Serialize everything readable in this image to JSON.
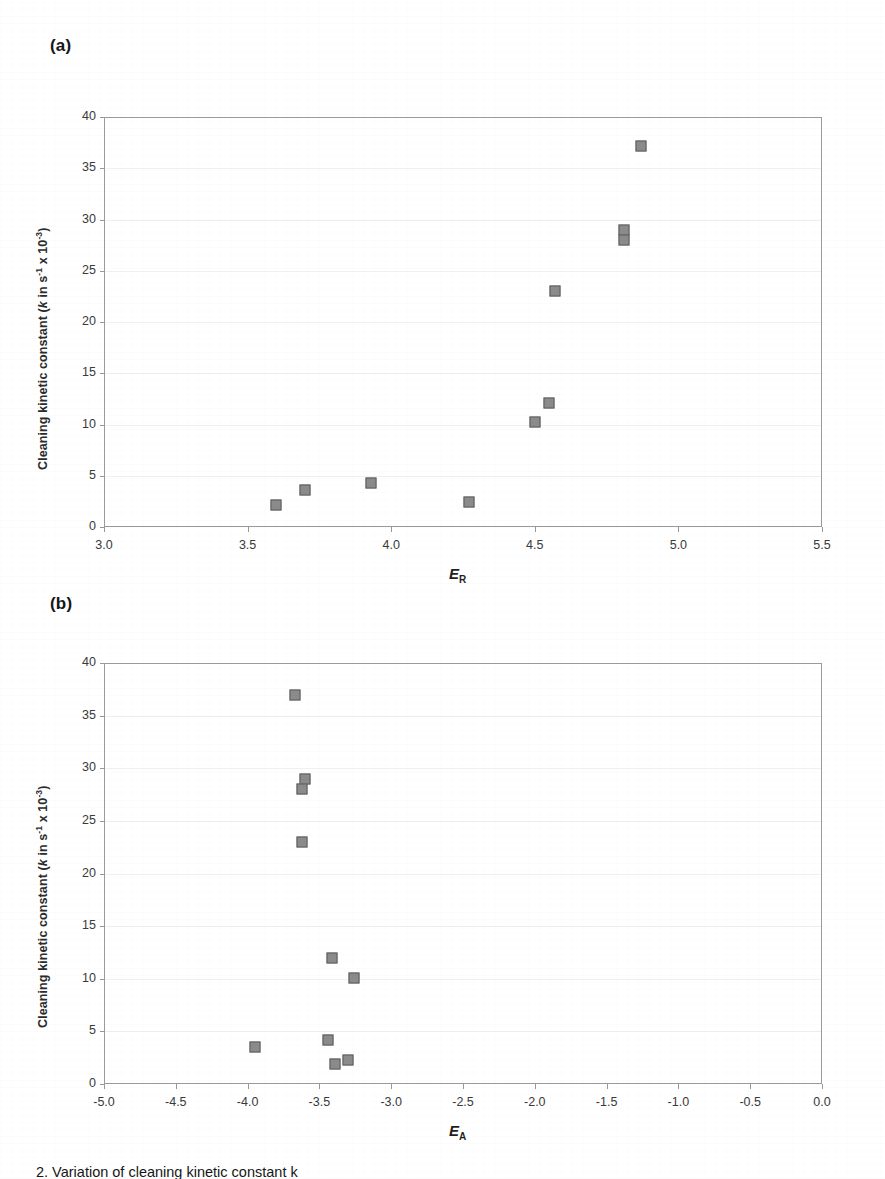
{
  "figure": {
    "panels": [
      {
        "letter": "(a)",
        "ylabel_text": "Cleaning kinetic constant (k in s-1 x 10-3)",
        "xlabel_text": "E",
        "xlabel_sub": "R"
      },
      {
        "letter": "(b)",
        "ylabel_text": "Cleaning kinetic constant (k in s-1 x 10-3)",
        "xlabel_text": "E",
        "xlabel_sub": "A"
      }
    ],
    "caption": "2. Variation of cleaning kinetic constant k"
  },
  "chart_data": [
    {
      "type": "scatter",
      "title": "(a)",
      "xlabel": "E_R",
      "ylabel": "Cleaning kinetic constant (k in s^-1 x 10^-3)",
      "xlim": [
        3.0,
        5.5
      ],
      "ylim": [
        0,
        40
      ],
      "xticks": [
        "3.0",
        "3.5",
        "4.0",
        "4.5",
        "5.0",
        "5.5"
      ],
      "xtick_values": [
        3.0,
        3.5,
        4.0,
        4.5,
        5.0,
        5.5
      ],
      "yticks": [
        "0",
        "5",
        "10",
        "15",
        "20",
        "25",
        "30",
        "35",
        "40"
      ],
      "ytick_values": [
        0,
        5,
        10,
        15,
        20,
        25,
        30,
        35,
        40
      ],
      "grid": true,
      "legend": "none",
      "marker": "filled-square-gray",
      "points": [
        {
          "x": 3.6,
          "y": 2.1
        },
        {
          "x": 3.7,
          "y": 3.6
        },
        {
          "x": 3.93,
          "y": 4.3
        },
        {
          "x": 4.27,
          "y": 2.4
        },
        {
          "x": 4.5,
          "y": 10.2
        },
        {
          "x": 4.55,
          "y": 12.1
        },
        {
          "x": 4.57,
          "y": 23.0
        },
        {
          "x": 4.81,
          "y": 29.0
        },
        {
          "x": 4.81,
          "y": 28.0
        },
        {
          "x": 4.87,
          "y": 37.2
        }
      ]
    },
    {
      "type": "scatter",
      "title": "(b)",
      "xlabel": "E_A",
      "ylabel": "Cleaning kinetic constant (k in s^-1 x 10^-3)",
      "xlim": [
        -5.0,
        0.0
      ],
      "ylim": [
        0,
        40
      ],
      "xticks": [
        "-5.0",
        "-4.5",
        "-4.0",
        "-3.5",
        "-3.0",
        "-2.5",
        "-2.0",
        "-1.5",
        "-1.0",
        "-0.5",
        "0.0"
      ],
      "xtick_values": [
        -5.0,
        -4.5,
        -4.0,
        -3.5,
        -3.0,
        -2.5,
        -2.0,
        -1.5,
        -1.0,
        -0.5,
        0.0
      ],
      "yticks": [
        "0",
        "5",
        "10",
        "15",
        "20",
        "25",
        "30",
        "35",
        "40"
      ],
      "ytick_values": [
        0,
        5,
        10,
        15,
        20,
        25,
        30,
        35,
        40
      ],
      "grid": true,
      "legend": "none",
      "marker": "filled-square-gray",
      "points": [
        {
          "x": -3.67,
          "y": 37.0
        },
        {
          "x": -3.6,
          "y": 29.0
        },
        {
          "x": -3.62,
          "y": 28.0
        },
        {
          "x": -3.62,
          "y": 23.0
        },
        {
          "x": -3.41,
          "y": 12.0
        },
        {
          "x": -3.26,
          "y": 10.1
        },
        {
          "x": -3.95,
          "y": 3.5
        },
        {
          "x": -3.44,
          "y": 4.2
        },
        {
          "x": -3.39,
          "y": 1.9
        },
        {
          "x": -3.3,
          "y": 2.3
        }
      ]
    }
  ]
}
